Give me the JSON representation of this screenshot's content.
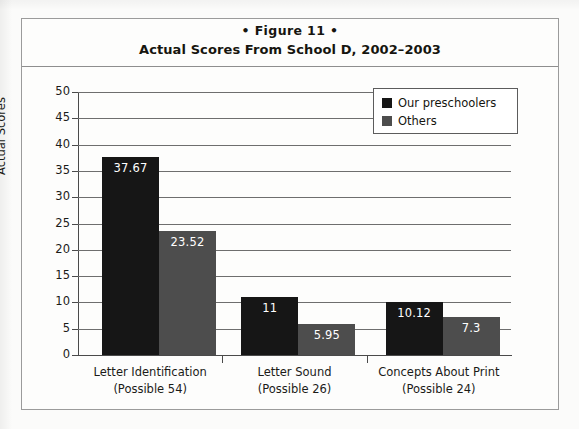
{
  "figure": {
    "label": "• Figure 11 •",
    "title": "Actual Scores From School D, 2002–2003"
  },
  "legend": {
    "items": [
      {
        "label": "Our preschoolers",
        "color": "#161616",
        "swatch": "square-swatch"
      },
      {
        "label": "Others",
        "color": "#4d4d4d",
        "swatch": "square-swatch"
      }
    ]
  },
  "axes": {
    "y_title": "Actual Scores",
    "y_ticks": [
      "50",
      "45",
      "40",
      "35",
      "30",
      "25",
      "20",
      "15",
      "10",
      "5",
      "0"
    ]
  },
  "categories": [
    {
      "name": "Letter Identification",
      "possible": "(Possible 54)"
    },
    {
      "name": "Letter Sound",
      "possible": "(Possible 26)"
    },
    {
      "name": "Concepts About Print",
      "possible": "(Possible 24)"
    }
  ],
  "bar_labels": {
    "g0s0": "37.67",
    "g0s1": "23.52",
    "g1s0": "11",
    "g1s1": "5.95",
    "g2s0": "10.12",
    "g2s1": "7.3"
  },
  "chart_data": {
    "type": "bar",
    "title": "Actual Scores From School D, 2002–2003",
    "subtitle": "• Figure 11 •",
    "xlabel": "",
    "ylabel": "Actual Scores",
    "ylim": [
      0,
      50
    ],
    "ytick_step": 5,
    "grid": true,
    "legend_position": "top-right",
    "categories": [
      "Letter Identification (Possible 54)",
      "Letter Sound (Possible 26)",
      "Concepts About Print (Possible 24)"
    ],
    "series": [
      {
        "name": "Our preschoolers",
        "color": "#161616",
        "values": [
          37.67,
          11,
          10.12
        ]
      },
      {
        "name": "Others",
        "color": "#4d4d4d",
        "values": [
          23.52,
          5.95,
          7.3
        ]
      }
    ]
  }
}
